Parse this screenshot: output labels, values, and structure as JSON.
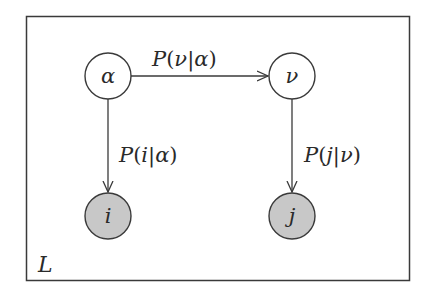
{
  "diagram": {
    "type": "graphical-model",
    "plate": {
      "label": "L"
    },
    "nodes": [
      {
        "id": "alpha",
        "label": "α",
        "observed": false
      },
      {
        "id": "nu",
        "label": "ν",
        "observed": false
      },
      {
        "id": "i",
        "label": "i",
        "observed": true
      },
      {
        "id": "j",
        "label": "j",
        "observed": true
      }
    ],
    "edges": [
      {
        "from": "alpha",
        "to": "nu",
        "label": {
          "P": "P",
          "open": "(",
          "var": "ν",
          "bar": "|",
          "given": "α",
          "close": ")"
        }
      },
      {
        "from": "alpha",
        "to": "i",
        "label": {
          "P": "P",
          "open": "(",
          "var": "i",
          "bar": "|",
          "given": "α",
          "close": ")"
        }
      },
      {
        "from": "nu",
        "to": "j",
        "label": {
          "P": "P",
          "open": "(",
          "var": "j",
          "bar": "|",
          "given": "ν",
          "close": ")"
        }
      }
    ],
    "colors": {
      "stroke": "#3a3a3a",
      "observed_fill": "#c8c8c8",
      "latent_fill": "#ffffff",
      "text": "#2a2a2a"
    }
  }
}
